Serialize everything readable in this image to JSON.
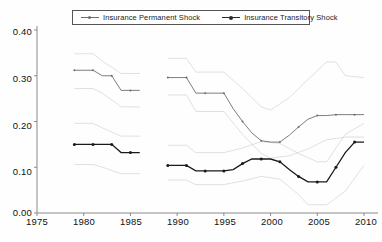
{
  "chart_data": {
    "type": "line",
    "title": "",
    "xlabel": "",
    "ylabel": "",
    "xlim": [
      1975,
      2011.5
    ],
    "ylim": [
      0.0,
      0.4
    ],
    "yticks": [
      "0.00",
      "0.10",
      "0.20",
      "0.30",
      "0.40"
    ],
    "ytick_values": [
      0.0,
      0.1,
      0.2,
      0.3,
      0.4
    ],
    "xticks": [
      "1975",
      "1980",
      "1985",
      "1990",
      "1995",
      "2000",
      "2005",
      "2010"
    ],
    "xtick_values": [
      1975,
      1980,
      1985,
      1990,
      1995,
      2000,
      2005,
      2010
    ],
    "grid": false,
    "legend_position": "top-center",
    "note": "Two estimated variance series with faint confidence-interval bands; data break between 1986 and 1989",
    "series": [
      {
        "name": "Insurance Permanent Shock",
        "color": "#6e6e6e",
        "marker": "dot-small",
        "segments": [
          {
            "x": [
              1979,
              1980,
              1981,
              1982,
              1983,
              1984,
              1985,
              1986
            ],
            "y": [
              0.312,
              0.312,
              0.312,
              0.3,
              0.3,
              0.268,
              0.268,
              0.268
            ]
          },
          {
            "x": [
              1989,
              1990,
              1991,
              1992,
              1993,
              1994,
              1995,
              1996,
              1997,
              1998,
              1999,
              2000,
              2001,
              2002,
              2003,
              2004,
              2005,
              2006,
              2007,
              2008,
              2009,
              2010
            ],
            "y": [
              0.296,
              0.296,
              0.296,
              0.262,
              0.262,
              0.262,
              0.262,
              0.228,
              0.2,
              0.175,
              0.158,
              0.155,
              0.155,
              0.17,
              0.188,
              0.205,
              0.213,
              0.213,
              0.215,
              0.215,
              0.215,
              0.215
            ]
          }
        ]
      },
      {
        "name": "Insurance Transitory Shock",
        "color": "#1a1a1a",
        "marker": "dot",
        "segments": [
          {
            "x": [
              1979,
              1980,
              1981,
              1982,
              1983,
              1984,
              1985,
              1986
            ],
            "y": [
              0.15,
              0.15,
              0.15,
              0.15,
              0.15,
              0.132,
              0.132,
              0.132
            ]
          },
          {
            "x": [
              1989,
              1990,
              1991,
              1992,
              1993,
              1994,
              1995,
              1996,
              1997,
              1998,
              1999,
              2000,
              2001,
              2002,
              2003,
              2004,
              2005,
              2006,
              2007,
              2008,
              2009,
              2010
            ],
            "y": [
              0.104,
              0.104,
              0.104,
              0.092,
              0.092,
              0.092,
              0.092,
              0.095,
              0.108,
              0.118,
              0.118,
              0.118,
              0.112,
              0.095,
              0.08,
              0.068,
              0.068,
              0.068,
              0.1,
              0.132,
              0.155,
              0.155
            ]
          }
        ]
      },
      {
        "name": "Permanent upper band",
        "color": "#d8d8d8",
        "marker": "none",
        "segments": [
          {
            "x": [
              1979,
              1981,
              1982,
              1984,
              1986
            ],
            "y": [
              0.348,
              0.348,
              0.332,
              0.305,
              0.305
            ]
          },
          {
            "x": [
              1989,
              1991,
              1992,
              1995,
              1997,
              1999,
              2000,
              2002,
              2004,
              2006,
              2007,
              2008,
              2010
            ],
            "y": [
              0.338,
              0.338,
              0.308,
              0.308,
              0.272,
              0.232,
              0.225,
              0.252,
              0.292,
              0.33,
              0.33,
              0.3,
              0.296
            ]
          }
        ]
      },
      {
        "name": "Permanent lower band",
        "color": "#d8d8d8",
        "marker": "none",
        "segments": [
          {
            "x": [
              1979,
              1981,
              1982,
              1984,
              1986
            ],
            "y": [
              0.272,
              0.272,
              0.262,
              0.232,
              0.232
            ]
          },
          {
            "x": [
              1989,
              1991,
              1992,
              1995,
              1997,
              1999,
              2000,
              2002,
              2004,
              2006,
              2008,
              2010
            ],
            "y": [
              0.258,
              0.258,
              0.222,
              0.222,
              0.172,
              0.13,
              0.12,
              0.125,
              0.14,
              0.16,
              0.166,
              0.166
            ]
          }
        ]
      },
      {
        "name": "Transitory upper band",
        "color": "#d8d8d8",
        "marker": "none",
        "segments": [
          {
            "x": [
              1979,
              1981,
              1982,
              1984,
              1986
            ],
            "y": [
              0.196,
              0.196,
              0.186,
              0.168,
              0.168
            ]
          },
          {
            "x": [
              1989,
              1991,
              1992,
              1995,
              1997,
              1999,
              2001,
              2003,
              2005,
              2006,
              2008,
              2010
            ],
            "y": [
              0.148,
              0.148,
              0.132,
              0.132,
              0.142,
              0.156,
              0.152,
              0.13,
              0.112,
              0.112,
              0.172,
              0.196
            ]
          }
        ]
      },
      {
        "name": "Transitory lower band",
        "color": "#d8d8d8",
        "marker": "none",
        "segments": [
          {
            "x": [
              1979,
              1981,
              1982,
              1984,
              1986
            ],
            "y": [
              0.106,
              0.106,
              0.1,
              0.086,
              0.086
            ]
          },
          {
            "x": [
              1989,
              1991,
              1992,
              1995,
              1997,
              1999,
              2001,
              2003,
              2004,
              2006,
              2008,
              2010
            ],
            "y": [
              0.072,
              0.072,
              0.062,
              0.062,
              0.07,
              0.08,
              0.074,
              0.04,
              0.018,
              0.018,
              0.048,
              0.104
            ]
          }
        ]
      }
    ]
  }
}
